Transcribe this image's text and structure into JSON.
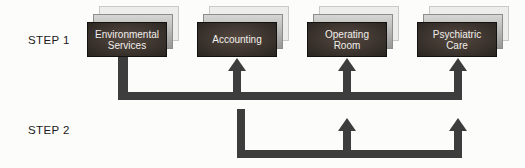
{
  "diagram": {
    "colors": {
      "background": "#fcfcfb",
      "line": "#3d3d3d",
      "boxCenter": "#554941",
      "boxEdge": "#282420",
      "boxText": "#f2efec",
      "label": "#1a1a1a"
    },
    "steps": [
      {
        "label": "STEP 1"
      },
      {
        "label": "STEP 2"
      }
    ],
    "departments": [
      {
        "id": "environmental-services",
        "label": "Environmental\nServices"
      },
      {
        "id": "accounting",
        "label": "Accounting"
      },
      {
        "id": "operating-room",
        "label": "Operating\nRoom"
      },
      {
        "id": "psychiatric-care",
        "label": "Psychiatric\nCare"
      }
    ],
    "flows": [
      {
        "step": "STEP 1",
        "from": "Environmental Services",
        "to": [
          "Accounting",
          "Operating Room",
          "Psychiatric Care"
        ]
      },
      {
        "step": "STEP 2",
        "from": "Accounting",
        "to": [
          "Operating Room",
          "Psychiatric Care"
        ]
      }
    ]
  }
}
